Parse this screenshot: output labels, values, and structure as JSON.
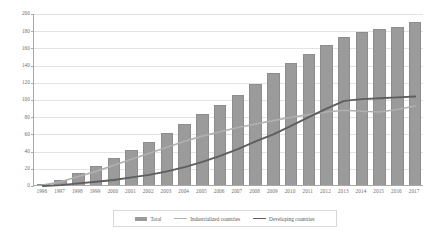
{
  "chart_data": {
    "type": "bar",
    "title": "",
    "subtitle": "",
    "xlabel": "",
    "ylabel": "",
    "ylim": [
      0,
      200
    ],
    "ytick_step": 20,
    "yticks": [
      0,
      20,
      40,
      60,
      80,
      100,
      120,
      140,
      160,
      180,
      200
    ],
    "grid": true,
    "legend_position": "bottom",
    "categories": [
      "1996",
      "1997",
      "1998",
      "1999",
      "2000",
      "2001",
      "2002",
      "2003",
      "2004",
      "2005",
      "2006",
      "2007",
      "2008",
      "2009",
      "2010",
      "2011",
      "2012",
      "2013",
      "2014",
      "2015",
      "2016",
      "2017"
    ],
    "series": [
      {
        "name": "Total",
        "type": "bar",
        "color": "#9b9b9b",
        "values": [
          1,
          6,
          14,
          22,
          31,
          41,
          50,
          60,
          71,
          82,
          93,
          105,
          118,
          130,
          142,
          152,
          163,
          172,
          178,
          181,
          184,
          190
        ]
      },
      {
        "name": "Industrialized countries",
        "type": "line",
        "color": "#b0b0b0",
        "values": [
          1,
          5,
          11,
          17,
          24,
          31,
          38,
          45,
          52,
          58,
          63,
          68,
          72,
          76,
          80,
          83,
          86,
          88,
          87,
          86,
          89,
          93
        ]
      },
      {
        "name": "Developing countries",
        "type": "line",
        "color": "#5e5e5e",
        "values": [
          0,
          1,
          3,
          5,
          7,
          10,
          13,
          17,
          22,
          28,
          35,
          43,
          52,
          60,
          70,
          80,
          90,
          99,
          101,
          102,
          103,
          104
        ]
      }
    ]
  },
  "legend": {
    "items": [
      {
        "label": "Total",
        "marker": "bar-swatch"
      },
      {
        "label": "Industrialized countries",
        "marker": "line-swatch-light"
      },
      {
        "label": "Developing countries",
        "marker": "line-swatch-dark"
      }
    ]
  }
}
